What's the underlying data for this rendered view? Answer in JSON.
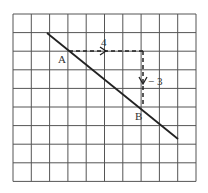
{
  "diagram": {
    "grid": {
      "cols": 10,
      "rows": 9,
      "x0": 13,
      "y0": 14,
      "cell_w": 18.3,
      "cell_h": 18.6,
      "color": "#555555"
    },
    "line": {
      "x1": 47,
      "y1": 33,
      "x2": 178,
      "y2": 139,
      "color": "#222222"
    },
    "points": [
      {
        "label": "A",
        "x": 69,
        "y": 51
      },
      {
        "label": "B",
        "x": 143,
        "y": 107
      }
    ],
    "run": {
      "label": "4",
      "value": 4
    },
    "rise": {
      "label": "− 3",
      "value": -3
    }
  }
}
